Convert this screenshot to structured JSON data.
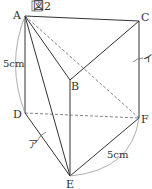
{
  "figure": {
    "title": "図2",
    "vertices": {
      "A": {
        "label": "A",
        "x": 25,
        "y": 16
      },
      "B": {
        "label": "B",
        "x": 70,
        "y": 80
      },
      "C": {
        "label": "C",
        "x": 139,
        "y": 21
      },
      "D": {
        "label": "D",
        "x": 25,
        "y": 113
      },
      "E": {
        "label": "E",
        "x": 70,
        "y": 176
      },
      "F": {
        "label": "F",
        "x": 139,
        "y": 118
      }
    },
    "solid_edges": [
      [
        "A",
        "C"
      ],
      [
        "A",
        "B"
      ],
      [
        "B",
        "C"
      ],
      [
        "C",
        "F"
      ],
      [
        "A",
        "D"
      ],
      [
        "D",
        "E"
      ],
      [
        "B",
        "E"
      ],
      [
        "A",
        "E"
      ],
      [
        "E",
        "F"
      ]
    ],
    "dashed_edges": [
      [
        "A",
        "F"
      ],
      [
        "D",
        "F"
      ]
    ],
    "annotations": {
      "ad_length": "5cm",
      "ef_length": "5cm",
      "label_a": "ア",
      "label_i": "イ"
    },
    "colors": {
      "line": "#333333",
      "dashed": "#777777",
      "arc": "#999999"
    }
  }
}
